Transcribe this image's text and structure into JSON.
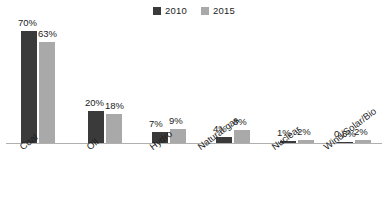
{
  "chart_data": {
    "type": "bar",
    "title": "",
    "subtitle": "",
    "xlabel": "",
    "ylabel": "",
    "grid": false,
    "legend_position": "top-center",
    "ylim": [
      0,
      75
    ],
    "categories": [
      "Coal",
      "Oil",
      "Hydro",
      "Natural gas",
      "Nuclear",
      "Wind/Solar/Bio"
    ],
    "series": [
      {
        "name": "2010",
        "color": "#3a3a3a",
        "values": [
          70,
          20,
          7,
          4,
          1,
          0.8
        ],
        "labels": [
          "70%",
          "20%",
          "7%",
          "4%",
          "1%",
          "0.8%"
        ]
      },
      {
        "name": "2015",
        "color": "#a9a9a9",
        "values": [
          63,
          18,
          9,
          8,
          2,
          2
        ],
        "labels": [
          "63%",
          "18%",
          "9%",
          "8%",
          "2%",
          "2%"
        ]
      }
    ]
  },
  "legend": {
    "entries": [
      {
        "label": "2010",
        "color": "#3a3a3a",
        "swatch_name": "legend-swatch-2010"
      },
      {
        "label": "2015",
        "color": "#a9a9a9",
        "swatch_name": "legend-swatch-2015"
      }
    ]
  },
  "axis": {
    "baseline_color": "#b0b0b0"
  }
}
